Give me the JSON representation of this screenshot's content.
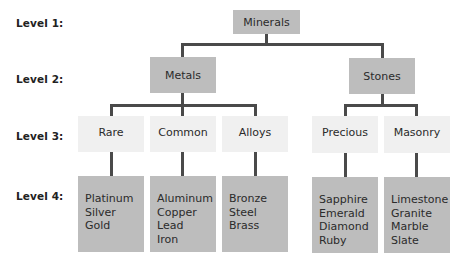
{
  "levels": [
    "Level 1:",
    "Level 2:",
    "Level 3:",
    "Level 4:"
  ],
  "root": {
    "label": "Minerals"
  },
  "categories": [
    {
      "label": "Metals",
      "subcategories": [
        {
          "label": "Rare",
          "items": [
            "Platinum",
            "Silver",
            "Gold"
          ]
        },
        {
          "label": "Common",
          "items": [
            "Aluminum",
            "Copper",
            "Lead",
            "Iron"
          ]
        },
        {
          "label": "Alloys",
          "items": [
            "Bronze",
            "Steel",
            "Brass"
          ]
        }
      ]
    },
    {
      "label": "Stones",
      "subcategories": [
        {
          "label": "Precious",
          "items": [
            "Sapphire",
            "Emerald",
            "Diamond",
            "Ruby"
          ]
        },
        {
          "label": "Masonry",
          "items": [
            "Limestone",
            "Granite",
            "Marble",
            "Slate"
          ]
        }
      ]
    }
  ],
  "colors": {
    "node_dark": "#bdbdbd",
    "node_light": "#f0f0f0",
    "connector": "#4a4a4a"
  }
}
